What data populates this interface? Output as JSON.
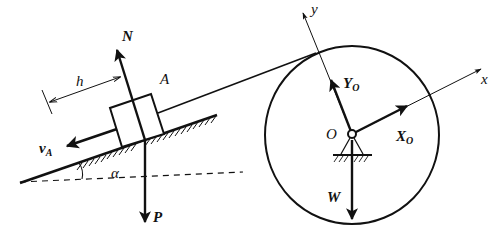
{
  "figure": {
    "type": "free-body diagram",
    "colors": {
      "ink": "#111111",
      "background": "#ffffff"
    },
    "labels": {
      "normal_force": "N",
      "weight_block": "P",
      "block": "A",
      "distance": "h",
      "velocity": "v",
      "velocity_sub": "A",
      "angle": "α",
      "y_axis": "y",
      "x_axis": "x",
      "reaction_y": "Y",
      "reaction_y_sub": "O",
      "reaction_x": "X",
      "reaction_x_sub": "O",
      "pivot": "O",
      "weight_wheel": "W"
    },
    "elements": [
      "inclined plane with hatching",
      "block A on incline",
      "rope from block to wheel",
      "wheel (circle) with pinned support O",
      "force arrows N, P, v_A, Y_O, X_O, W",
      "rotated axes x, y at O",
      "dashed horizontal reference line",
      "angle alpha"
    ]
  }
}
